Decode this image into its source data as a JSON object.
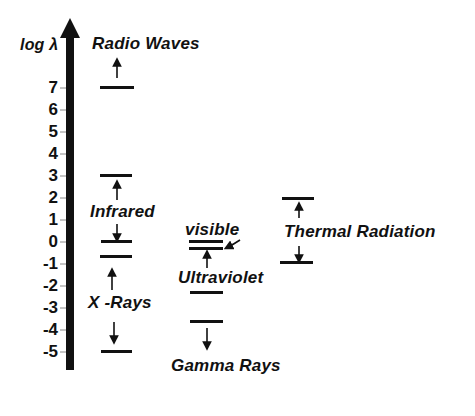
{
  "axis": {
    "label": "log λ",
    "ticks": [
      "7",
      "6",
      "5",
      "4",
      "3",
      "2",
      "1",
      "0",
      "-1",
      "-2",
      "-3",
      "-4",
      "-5"
    ]
  },
  "bands": {
    "radio": {
      "label": "Radio  Waves",
      "lower_log": 7
    },
    "infrared": {
      "label": "Infrared",
      "upper_log": 3,
      "lower_log": 0
    },
    "xrays": {
      "label": "X -Rays",
      "upper_log": -0.7,
      "lower_log": -5
    },
    "visible": {
      "label": "visible",
      "upper_log": -0.1,
      "lower_log": -0.3
    },
    "ultraviolet": {
      "label": "Ultraviolet",
      "upper_log": -0.3,
      "lower_log": -2.3
    },
    "gamma": {
      "label": "Gamma Rays",
      "upper_log": -3.6
    },
    "thermal": {
      "label": "Thermal  Radiation",
      "upper_log": 1.9,
      "lower_log": -0.8
    }
  }
}
